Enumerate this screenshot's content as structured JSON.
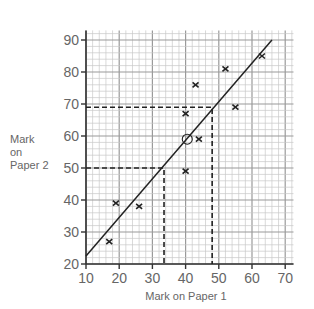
{
  "chart_data": {
    "type": "scatter",
    "title": "",
    "xlabel": "Mark on Paper 1",
    "ylabel": "Mark on Paper 2",
    "xlim": [
      10,
      72
    ],
    "ylim": [
      20,
      93
    ],
    "x_ticks": [
      10,
      20,
      30,
      40,
      50,
      60,
      70
    ],
    "y_ticks": [
      20,
      30,
      40,
      50,
      60,
      70,
      80,
      90
    ],
    "grid": true,
    "points": [
      {
        "x": 17,
        "y": 27
      },
      {
        "x": 19,
        "y": 39
      },
      {
        "x": 26,
        "y": 38
      },
      {
        "x": 40,
        "y": 49
      },
      {
        "x": 40,
        "y": 67
      },
      {
        "x": 44,
        "y": 59
      },
      {
        "x": 43,
        "y": 76
      },
      {
        "x": 52,
        "y": 81
      },
      {
        "x": 55,
        "y": 69
      },
      {
        "x": 63,
        "y": 85
      }
    ],
    "mean_point": {
      "x": 40.5,
      "y": 59,
      "marker": "circle"
    },
    "line_of_best_fit": {
      "x1": 10,
      "y1": 22.5,
      "x2": 66,
      "y2": 90
    },
    "annotations": [
      {
        "type": "dashed-lookup",
        "y": 50,
        "x": 33.5
      },
      {
        "type": "dashed-lookup",
        "y": 69,
        "x": 48
      }
    ]
  },
  "labels": {
    "ylabel_lines": [
      "Mark",
      "on",
      "Paper 2"
    ],
    "xlabel": "Mark on Paper 1"
  }
}
